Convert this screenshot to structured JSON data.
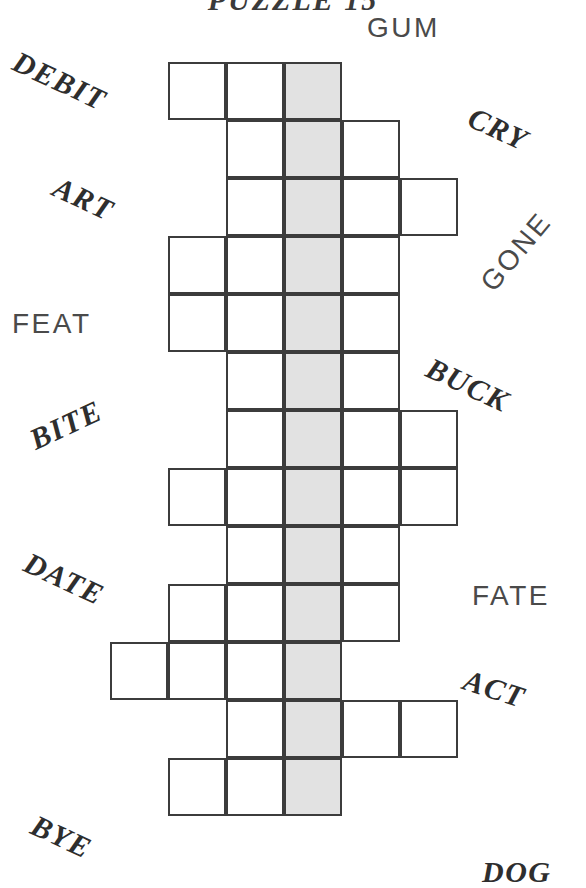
{
  "title": "PUZZLE 15",
  "grid": {
    "shaded_column_index": 2,
    "cell_size": 58,
    "origin_x": 168,
    "origin_y": 62,
    "colors": {
      "cell_border": "#3c3c3c",
      "cell_fill": "#ffffff",
      "shaded_fill": "#e2e2e2",
      "text": "#2e2e2e"
    },
    "rows": [
      {
        "index": 0,
        "start_col": 0,
        "length": 3
      },
      {
        "index": 1,
        "start_col": 1,
        "length": 3
      },
      {
        "index": 2,
        "start_col": 1,
        "length": 4
      },
      {
        "index": 3,
        "start_col": 0,
        "length": 4
      },
      {
        "index": 4,
        "start_col": 0,
        "length": 4
      },
      {
        "index": 5,
        "start_col": 1,
        "length": 3
      },
      {
        "index": 6,
        "start_col": 1,
        "length": 4
      },
      {
        "index": 7,
        "start_col": 0,
        "length": 5
      },
      {
        "index": 8,
        "start_col": 1,
        "length": 3
      },
      {
        "index": 9,
        "start_col": 0,
        "length": 4
      },
      {
        "index": 10,
        "start_col": -1,
        "length": 4
      },
      {
        "index": 11,
        "start_col": 1,
        "length": 4
      },
      {
        "index": 12,
        "start_col": 0,
        "length": 3
      }
    ]
  },
  "clues": [
    {
      "id": "gum",
      "text": "GUM",
      "side": "right",
      "style": "plain",
      "x": 367,
      "y": 12,
      "rotate": 0
    },
    {
      "id": "debit",
      "text": "DEBIT",
      "side": "left",
      "style": "bold",
      "x": 10,
      "y": 64,
      "rotate": 25
    },
    {
      "id": "cry",
      "text": "CRY",
      "side": "right",
      "style": "bold",
      "x": 467,
      "y": 112,
      "rotate": 25
    },
    {
      "id": "art",
      "text": "ART",
      "side": "left",
      "style": "bold",
      "x": 52,
      "y": 182,
      "rotate": 25
    },
    {
      "id": "gone",
      "text": "GONE",
      "side": "right",
      "style": "plain",
      "x": 470,
      "y": 236,
      "rotate": -50
    },
    {
      "id": "feat",
      "text": "FEAT",
      "side": "left",
      "style": "plain",
      "x": 12,
      "y": 308,
      "rotate": 0
    },
    {
      "id": "buck",
      "text": "BUCK",
      "side": "right",
      "style": "bold",
      "x": 424,
      "y": 368,
      "rotate": 25
    },
    {
      "id": "bite",
      "text": "BITE",
      "side": "left",
      "style": "bold",
      "x": 28,
      "y": 408,
      "rotate": -25
    },
    {
      "id": "date",
      "text": "DATE",
      "side": "left",
      "style": "bold",
      "x": 22,
      "y": 562,
      "rotate": 25
    },
    {
      "id": "fate",
      "text": "FATE",
      "side": "right",
      "style": "plain",
      "x": 472,
      "y": 580,
      "rotate": 0
    },
    {
      "id": "act",
      "text": "ACT",
      "side": "right",
      "style": "bold",
      "x": 463,
      "y": 672,
      "rotate": 18
    },
    {
      "id": "bye",
      "text": "BYE",
      "side": "left",
      "style": "bold",
      "x": 30,
      "y": 820,
      "rotate": 25
    },
    {
      "id": "dog",
      "text": "DOG",
      "side": "right",
      "style": "bold",
      "x": 482,
      "y": 855,
      "rotate": 0
    }
  ]
}
